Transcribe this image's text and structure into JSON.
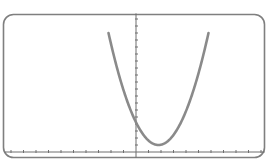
{
  "colors": {
    "frame": "#7f7f7f",
    "axis": "#6f6f6f",
    "curve": "#8a8a8a",
    "background": "#ffffff"
  },
  "chart_data": {
    "type": "line",
    "title": "",
    "xlabel": "",
    "ylabel": "",
    "grid": false,
    "legend": "none",
    "xlim": [
      -10.5,
      10.3
    ],
    "ylim": [
      -0.8,
      19.8
    ],
    "x_tick_step": 1,
    "y_tick_step": 1,
    "series": [
      {
        "name": "parabola",
        "equation": "y = (x - 1.8)^2 + 1",
        "vertex": [
          1.8,
          1.0
        ],
        "y_intercept": 4.24,
        "x": [
          -2.2,
          -1.5,
          -1,
          -0.5,
          0,
          0.5,
          1,
          1.5,
          1.8,
          2.5,
          3,
          3.5,
          4,
          4.5,
          5,
          5.5,
          5.8
        ],
        "y": [
          17.0,
          11.89,
          8.84,
          6.29,
          4.24,
          2.69,
          1.64,
          1.09,
          1.0,
          1.49,
          2.44,
          3.89,
          5.84,
          8.29,
          11.24,
          14.69,
          17.0
        ]
      }
    ]
  }
}
